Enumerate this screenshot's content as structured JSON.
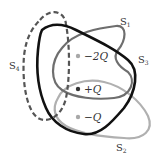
{
  "figure": {
    "colors": {
      "s1": "#6e6e6e",
      "s2": "#b0b0b0",
      "s3": "#111111",
      "s4": "#555555",
      "charge_neg": "#a8a8a8",
      "charge_pos": "#333333",
      "text": "#333333"
    }
  },
  "surfaces": [
    {
      "id": "S1",
      "letter": "S",
      "sub": "1",
      "style": "solid-medium-gray"
    },
    {
      "id": "S2",
      "letter": "S",
      "sub": "2",
      "style": "solid-light-gray"
    },
    {
      "id": "S3",
      "letter": "S",
      "sub": "3",
      "style": "solid-black-thick"
    },
    {
      "id": "S4",
      "letter": "S",
      "sub": "4",
      "style": "dashed-dark-gray"
    }
  ],
  "charges": [
    {
      "label": "−2Q",
      "value": "-2Q",
      "sign": "negative"
    },
    {
      "label": "+Q",
      "value": "+Q",
      "sign": "positive"
    },
    {
      "label": "−Q",
      "value": "-Q",
      "sign": "negative"
    }
  ]
}
